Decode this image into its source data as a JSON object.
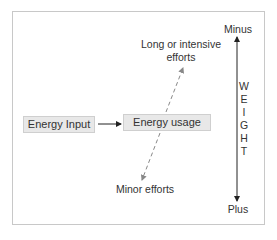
{
  "diagram": {
    "boxes": {
      "energy_input": "Energy Input",
      "energy_usage": "Energy usage"
    },
    "labels": {
      "long_efforts_line1": "Long or intensive",
      "long_efforts_line2": "efforts",
      "minor_efforts": "Minor efforts",
      "minus": "Minus",
      "plus": "Plus"
    },
    "weight_axis": {
      "letters": [
        "W",
        "E",
        "I",
        "G",
        "H",
        "T"
      ]
    },
    "colors": {
      "box_fill": "#e8e8e8",
      "frame_border": "#c8c8c8",
      "arrow": "#222222",
      "dashed_arrow": "#888888"
    }
  }
}
